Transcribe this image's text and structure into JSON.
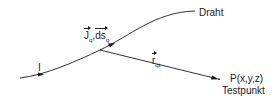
{
  "diagram": {
    "wire_label": "Draht",
    "current_label": "I",
    "element_label": {
      "current_density": "J",
      "current_density_sub": "q",
      "separator": ",",
      "line_element": "ds",
      "line_element_sub": "q"
    },
    "vector_label": {
      "symbol": "r",
      "sub": "qt"
    },
    "point_label": "P(x,y,z)",
    "point_caption": "Testpunkt",
    "colors": {
      "line": "#1a1a1a",
      "background": "#ffffff"
    }
  }
}
